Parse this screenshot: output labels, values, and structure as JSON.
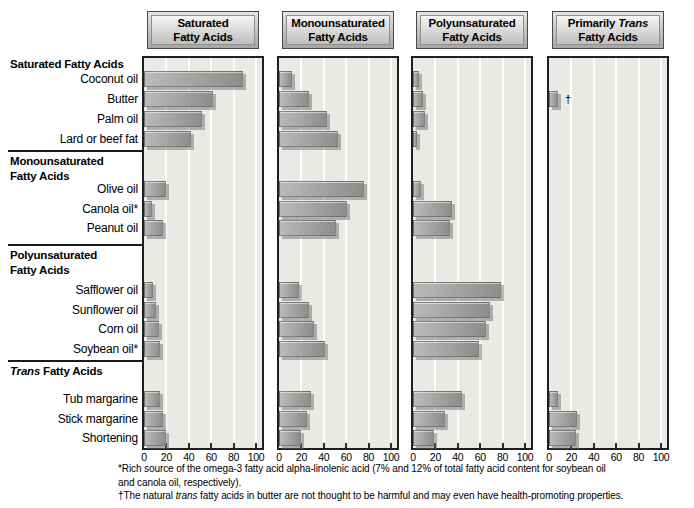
{
  "chart_data": {
    "type": "bar",
    "orientation": "horizontal",
    "axis": {
      "min": 0,
      "max": 100,
      "ticks": [
        0,
        20,
        40,
        60,
        80,
        100
      ],
      "grid": true
    },
    "panels": [
      {
        "name": "Saturated Fatty Acids",
        "title": [
          [
            {
              "t": "Saturated"
            }
          ],
          [
            {
              "t": "Fatty Acids"
            }
          ]
        ]
      },
      {
        "name": "Monounsaturated Fatty Acids",
        "title": [
          [
            {
              "t": "Monounsaturated"
            }
          ],
          [
            {
              "t": "Fatty Acids"
            }
          ]
        ]
      },
      {
        "name": "Polyunsaturated Fatty Acids",
        "title": [
          [
            {
              "t": "Polyunsaturated"
            }
          ],
          [
            {
              "t": "Fatty Acids"
            }
          ]
        ]
      },
      {
        "name": "Primarily Trans Fatty Acids",
        "title": [
          [
            {
              "t": "Primarily "
            },
            {
              "t": "Trans",
              "i": true
            }
          ],
          [
            {
              "t": "Fatty Acids"
            }
          ]
        ]
      }
    ],
    "groups": [
      {
        "heading": [
          [
            {
              "t": "Saturated Fatty Acids"
            }
          ]
        ],
        "rows": [
          {
            "label": "Coconut oil",
            "values": [
              88,
              12,
              5,
              0
            ]
          },
          {
            "label": "Butter",
            "values": [
              62,
              27,
              9,
              8
            ],
            "trans_marker": "†"
          },
          {
            "label": "Palm oil",
            "values": [
              52,
              43,
              11,
              0
            ]
          },
          {
            "label": "Lard or beef fat",
            "values": [
              42,
              53,
              4,
              0
            ]
          }
        ]
      },
      {
        "heading": [
          [
            {
              "t": "Monounsaturated"
            }
          ],
          [
            {
              "t": "Fatty Acids"
            }
          ]
        ],
        "rows": [
          {
            "label": "Olive oil",
            "values": [
              20,
              76,
              7,
              0
            ]
          },
          {
            "label": "Canola oil*",
            "values": [
              7,
              61,
              35,
              0
            ]
          },
          {
            "label": "Peanut oil",
            "values": [
              17,
              51,
              33,
              0
            ]
          }
        ]
      },
      {
        "heading": [
          [
            {
              "t": "Polyunsaturated"
            }
          ],
          [
            {
              "t": "Fatty Acids"
            }
          ]
        ],
        "rows": [
          {
            "label": "Safflower oil",
            "values": [
              8,
              18,
              79,
              0
            ]
          },
          {
            "label": "Sunflower oil",
            "values": [
              11,
              27,
              69,
              0
            ]
          },
          {
            "label": "Corn oil",
            "values": [
              13,
              31,
              65,
              0
            ]
          },
          {
            "label": "Soybean oil*",
            "values": [
              14,
              41,
              59,
              0
            ]
          }
        ]
      },
      {
        "heading": [
          [
            {
              "t": "Trans",
              "i": true
            },
            {
              "t": " Fatty Acids"
            }
          ]
        ],
        "rows": [
          {
            "label": "Tub margarine",
            "values": [
              14,
              29,
              44,
              8
            ]
          },
          {
            "label": "Stick margarine",
            "values": [
              17,
              25,
              29,
              25
            ]
          },
          {
            "label": "Shortening",
            "values": [
              20,
              20,
              19,
              24
            ]
          }
        ]
      }
    ],
    "footnotes": [
      {
        "lines": [
          [
            {
              "t": "*Rich source of the omega-3 fatty acid alpha-linolenic acid (7% and 12% of total fatty acid content for soybean oil"
            }
          ],
          [
            {
              "t": "and canola oil, respectively)."
            }
          ]
        ]
      },
      {
        "lines": [
          [
            {
              "t": "†The natural "
            },
            {
              "t": "trans",
              "i": true
            },
            {
              "t": " fatty acids in butter are not thought to be harmful and may even have health-promoting properties."
            }
          ]
        ]
      }
    ],
    "colors": {
      "bar_gradient_start": "#bababa",
      "bar_gradient_end": "#8d8d8b",
      "bar_shadow": "#6e6e6c",
      "plot_background": "#e9e9e6",
      "gridline": "#ffffff",
      "panel_border": "#1f1f1f",
      "header_gradient_top": "#f5f5f3",
      "header_gradient_bottom": "#a5a5a3",
      "text": "#000000"
    }
  }
}
